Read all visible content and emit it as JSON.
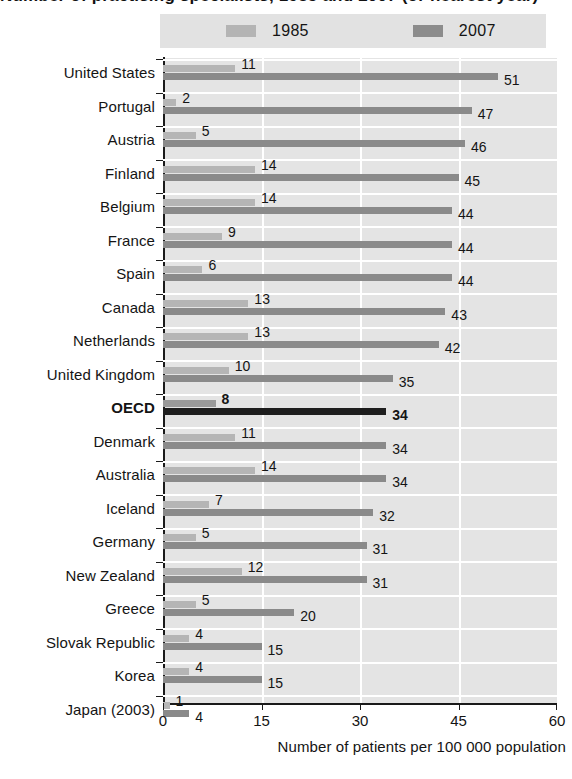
{
  "title_partial": "Number of practising specialists, 1985 and 2007 (or nearest year)",
  "legend": {
    "items": [
      {
        "label": "1985",
        "color": "#b5b5b5",
        "icon": "legend-swatch"
      },
      {
        "label": "2007",
        "color": "#8a8a8a",
        "icon": "legend-swatch"
      }
    ]
  },
  "axis": {
    "x_title": "Number of patients per 100 000 population",
    "x_ticks": [
      "0",
      "15",
      "30",
      "45",
      "60"
    ],
    "x_min": 0,
    "x_max": 60
  },
  "chart_data": {
    "type": "bar",
    "orientation": "horizontal",
    "title": "Number of patients per 100 000 population",
    "xlabel": "Number of patients per 100 000 population",
    "ylabel": "",
    "xlim": [
      0,
      60
    ],
    "grid": true,
    "gridlines_at": [
      15,
      30,
      45
    ],
    "legend_position": "top",
    "categories": [
      "United States",
      "Portugal",
      "Austria",
      "Finland",
      "Belgium",
      "France",
      "Spain",
      "Canada",
      "Netherlands",
      "United Kingdom",
      "OECD",
      "Denmark",
      "Australia",
      "Iceland",
      "Germany",
      "New Zealand",
      "Greece",
      "Slovak Republic",
      "Korea",
      "Japan (2003)"
    ],
    "series": [
      {
        "name": "1985",
        "color": "#b5b5b5",
        "values": [
          11,
          2,
          5,
          14,
          14,
          9,
          6,
          13,
          13,
          10,
          8,
          11,
          14,
          7,
          5,
          12,
          5,
          4,
          4,
          1
        ]
      },
      {
        "name": "2007",
        "color": "#8a8a8a",
        "values": [
          51,
          47,
          46,
          45,
          44,
          44,
          44,
          43,
          42,
          35,
          34,
          34,
          34,
          32,
          31,
          31,
          20,
          15,
          15,
          4
        ]
      }
    ],
    "highlight_category": "OECD",
    "highlight_color": "#1e1e1e"
  },
  "rows": [
    {
      "label": "United States",
      "v1985": 11,
      "v2007": 51,
      "highlight": false
    },
    {
      "label": "Portugal",
      "v1985": 2,
      "v2007": 47,
      "highlight": false
    },
    {
      "label": "Austria",
      "v1985": 5,
      "v2007": 46,
      "highlight": false
    },
    {
      "label": "Finland",
      "v1985": 14,
      "v2007": 45,
      "highlight": false
    },
    {
      "label": "Belgium",
      "v1985": 14,
      "v2007": 44,
      "highlight": false
    },
    {
      "label": "France",
      "v1985": 9,
      "v2007": 44,
      "highlight": false
    },
    {
      "label": "Spain",
      "v1985": 6,
      "v2007": 44,
      "highlight": false
    },
    {
      "label": "Canada",
      "v1985": 13,
      "v2007": 43,
      "highlight": false
    },
    {
      "label": "Netherlands",
      "v1985": 13,
      "v2007": 42,
      "highlight": false
    },
    {
      "label": "United Kingdom",
      "v1985": 10,
      "v2007": 35,
      "highlight": false
    },
    {
      "label": "OECD",
      "v1985": 8,
      "v2007": 34,
      "highlight": true
    },
    {
      "label": "Denmark",
      "v1985": 11,
      "v2007": 34,
      "highlight": false
    },
    {
      "label": "Australia",
      "v1985": 14,
      "v2007": 34,
      "highlight": false
    },
    {
      "label": "Iceland",
      "v1985": 7,
      "v2007": 32,
      "highlight": false
    },
    {
      "label": "Germany",
      "v1985": 5,
      "v2007": 31,
      "highlight": false
    },
    {
      "label": "New Zealand",
      "v1985": 12,
      "v2007": 31,
      "highlight": false
    },
    {
      "label": "Greece",
      "v1985": 5,
      "v2007": 20,
      "highlight": false
    },
    {
      "label": "Slovak Republic",
      "v1985": 4,
      "v2007": 15,
      "highlight": false
    },
    {
      "label": "Korea",
      "v1985": 4,
      "v2007": 15,
      "highlight": false
    },
    {
      "label": "Japan (2003)",
      "v1985": 1,
      "v2007": 4,
      "highlight": false
    }
  ]
}
